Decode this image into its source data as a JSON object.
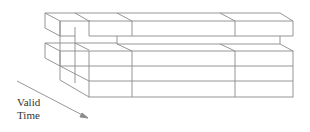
{
  "diagram": {
    "axis_label_line1": "Valid",
    "axis_label_line2": "Time",
    "stroke_color": "#8a8a8a",
    "background": "#ffffff"
  }
}
